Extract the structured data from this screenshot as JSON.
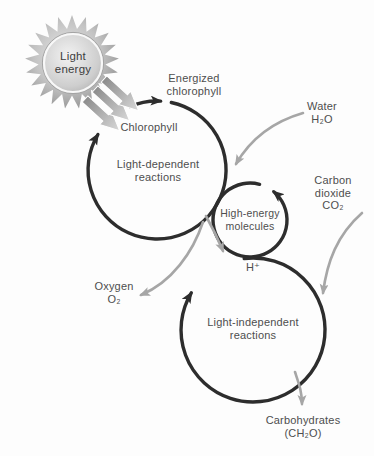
{
  "diagram": {
    "sun": {
      "label_line1": "Light",
      "label_line2": "energy"
    },
    "cycles": {
      "light_dependent": {
        "line1": "Light-dependent",
        "line2": "reactions"
      },
      "high_energy": {
        "line1": "High-energy",
        "line2": "molecules"
      },
      "light_independent": {
        "line1": "Light-independent",
        "line2": "reactions"
      }
    },
    "labels": {
      "energized_line1": "Energized",
      "energized_line2": "chlorophyll",
      "chlorophyll": "Chlorophyll",
      "water_line1": "Water",
      "water_line2": "H₂O",
      "carbon_line1": "Carbon",
      "carbon_line2": "dioxide",
      "carbon_line3": "CO₂",
      "h_plus": "H⁺",
      "oxygen_line1": "Oxygen",
      "oxygen_line2": "O₂",
      "carbohydrates_line1": "Carbohydrates",
      "carbohydrates_line2": "(CH₂O)"
    },
    "colors": {
      "cycle_stroke": "#2d2d2d",
      "flow_arrow_gray": "#a6a6a6",
      "label_text": "#4e4e4e",
      "sun_gray_dark": "#8e8e8e",
      "sun_gray_light": "#e9e9e9",
      "background": "#fdfdfd"
    }
  }
}
